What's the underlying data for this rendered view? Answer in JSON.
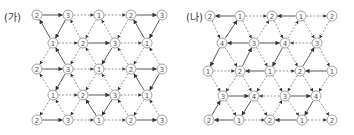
{
  "diagrams": [
    {
      "id": "ga",
      "label": "(가)",
      "label_pos": [
        4,
        9
      ],
      "nodes": [
        {
          "x": 37,
          "y": 15,
          "v": "2"
        },
        {
          "x": 68,
          "y": 15,
          "v": "3"
        },
        {
          "x": 99,
          "y": 15,
          "v": "1"
        },
        {
          "x": 131,
          "y": 15,
          "v": "2"
        },
        {
          "x": 162,
          "y": 15,
          "v": "3"
        },
        {
          "x": 53,
          "y": 43,
          "v": "1"
        },
        {
          "x": 83,
          "y": 43,
          "v": "2"
        },
        {
          "x": 115,
          "y": 43,
          "v": "3"
        },
        {
          "x": 147,
          "y": 43,
          "v": "1"
        },
        {
          "x": 37,
          "y": 69,
          "v": "2"
        },
        {
          "x": 68,
          "y": 69,
          "v": "3"
        },
        {
          "x": 99,
          "y": 69,
          "v": "1"
        },
        {
          "x": 131,
          "y": 69,
          "v": "2"
        },
        {
          "x": 162,
          "y": 69,
          "v": "3"
        },
        {
          "x": 53,
          "y": 95,
          "v": "1"
        },
        {
          "x": 83,
          "y": 95,
          "v": "2"
        },
        {
          "x": 115,
          "y": 95,
          "v": "3"
        },
        {
          "x": 147,
          "y": 95,
          "v": "1"
        },
        {
          "x": 37,
          "y": 120,
          "v": "2"
        },
        {
          "x": 68,
          "y": 120,
          "v": "3"
        },
        {
          "x": 99,
          "y": 120,
          "v": "1"
        },
        {
          "x": 131,
          "y": 120,
          "v": "2"
        },
        {
          "x": 162,
          "y": 120,
          "v": "3"
        }
      ],
      "edges": [
        {
          "a": 0,
          "b": 1,
          "s": "solid"
        },
        {
          "a": 1,
          "b": 2,
          "s": "dash"
        },
        {
          "a": 2,
          "b": 3,
          "s": "dash"
        },
        {
          "a": 3,
          "b": 4,
          "s": "solid"
        },
        {
          "a": 5,
          "b": 6,
          "s": "dash"
        },
        {
          "a": 6,
          "b": 7,
          "s": "solid"
        },
        {
          "a": 7,
          "b": 8,
          "s": "dash"
        },
        {
          "a": 9,
          "b": 10,
          "s": "solid"
        },
        {
          "a": 10,
          "b": 11,
          "s": "dash"
        },
        {
          "a": 11,
          "b": 12,
          "s": "dash"
        },
        {
          "a": 12,
          "b": 13,
          "s": "solid"
        },
        {
          "a": 14,
          "b": 15,
          "s": "dash"
        },
        {
          "a": 15,
          "b": 16,
          "s": "solid"
        },
        {
          "a": 16,
          "b": 17,
          "s": "dash"
        },
        {
          "a": 18,
          "b": 19,
          "s": "solid"
        },
        {
          "a": 19,
          "b": 20,
          "s": "dash"
        },
        {
          "a": 20,
          "b": 21,
          "s": "dash"
        },
        {
          "a": 21,
          "b": 22,
          "s": "solid"
        },
        {
          "a": 5,
          "b": 0,
          "s": "solid"
        },
        {
          "a": 1,
          "b": 5,
          "s": "solid"
        },
        {
          "a": 6,
          "b": 1,
          "s": "dash"
        },
        {
          "a": 2,
          "b": 6,
          "s": "dash"
        },
        {
          "a": 7,
          "b": 2,
          "s": "dash"
        },
        {
          "a": 3,
          "b": 7,
          "s": "dash"
        },
        {
          "a": 8,
          "b": 3,
          "s": "solid"
        },
        {
          "a": 4,
          "b": 8,
          "s": "solid"
        },
        {
          "a": 5,
          "b": 9,
          "s": "dash"
        },
        {
          "a": 10,
          "b": 5,
          "s": "solid"
        },
        {
          "a": 6,
          "b": 10,
          "s": "dash"
        },
        {
          "a": 11,
          "b": 6,
          "s": "dash"
        },
        {
          "a": 7,
          "b": 11,
          "s": "solid"
        },
        {
          "a": 12,
          "b": 7,
          "s": "dash"
        },
        {
          "a": 8,
          "b": 12,
          "s": "dash"
        },
        {
          "a": 13,
          "b": 8,
          "s": "dash"
        },
        {
          "a": 14,
          "b": 9,
          "s": "dash"
        },
        {
          "a": 10,
          "b": 14,
          "s": "solid"
        },
        {
          "a": 15,
          "b": 10,
          "s": "dash"
        },
        {
          "a": 11,
          "b": 15,
          "s": "dash"
        },
        {
          "a": 16,
          "b": 11,
          "s": "dash"
        },
        {
          "a": 12,
          "b": 16,
          "s": "dash"
        },
        {
          "a": 17,
          "b": 12,
          "s": "solid"
        },
        {
          "a": 13,
          "b": 17,
          "s": "solid"
        },
        {
          "a": 14,
          "b": 18,
          "s": "dash"
        },
        {
          "a": 19,
          "b": 14,
          "s": "dash"
        },
        {
          "a": 15,
          "b": 19,
          "s": "dash"
        },
        {
          "a": 20,
          "b": 15,
          "s": "solid"
        },
        {
          "a": 16,
          "b": 20,
          "s": "solid"
        },
        {
          "a": 21,
          "b": 16,
          "s": "dash"
        },
        {
          "a": 17,
          "b": 21,
          "s": "dash"
        },
        {
          "a": 22,
          "b": 17,
          "s": "dash"
        }
      ]
    },
    {
      "id": "na",
      "label": "(나)",
      "label_pos": [
        186,
        9
      ],
      "nodes": [
        {
          "x": 210,
          "y": 16,
          "v": "2"
        },
        {
          "x": 240,
          "y": 16,
          "v": "1"
        },
        {
          "x": 272,
          "y": 16,
          "v": "2"
        },
        {
          "x": 301,
          "y": 16,
          "v": "1"
        },
        {
          "x": 332,
          "y": 16,
          "v": "2"
        },
        {
          "x": 222,
          "y": 43,
          "v": "4"
        },
        {
          "x": 254,
          "y": 43,
          "v": "3"
        },
        {
          "x": 285,
          "y": 43,
          "v": "4"
        },
        {
          "x": 317,
          "y": 43,
          "v": "3"
        },
        {
          "x": 208,
          "y": 71,
          "v": "1"
        },
        {
          "x": 240,
          "y": 71,
          "v": "2"
        },
        {
          "x": 270,
          "y": 71,
          "v": "1"
        },
        {
          "x": 300,
          "y": 71,
          "v": "2"
        },
        {
          "x": 332,
          "y": 71,
          "v": "1"
        },
        {
          "x": 223,
          "y": 96,
          "v": "3"
        },
        {
          "x": 254,
          "y": 96,
          "v": "4"
        },
        {
          "x": 285,
          "y": 96,
          "v": "3"
        },
        {
          "x": 316,
          "y": 96,
          "v": "4"
        },
        {
          "x": 209,
          "y": 120,
          "v": "2"
        },
        {
          "x": 239,
          "y": 120,
          "v": "1"
        },
        {
          "x": 270,
          "y": 120,
          "v": "2"
        },
        {
          "x": 302,
          "y": 120,
          "v": "1"
        },
        {
          "x": 332,
          "y": 120,
          "v": "2"
        }
      ],
      "edges": [
        {
          "a": 1,
          "b": 0,
          "s": "solid"
        },
        {
          "a": 1,
          "b": 2,
          "s": "dash"
        },
        {
          "a": 3,
          "b": 2,
          "s": "solid"
        },
        {
          "a": 3,
          "b": 4,
          "s": "dash"
        },
        {
          "a": 6,
          "b": 5,
          "s": "solid"
        },
        {
          "a": 6,
          "b": 7,
          "s": "solid"
        },
        {
          "a": 8,
          "b": 7,
          "s": "dash"
        },
        {
          "a": 9,
          "b": 10,
          "s": "dash"
        },
        {
          "a": 11,
          "b": 10,
          "s": "solid"
        },
        {
          "a": 11,
          "b": 12,
          "s": "dash"
        },
        {
          "a": 13,
          "b": 12,
          "s": "solid"
        },
        {
          "a": 14,
          "b": 15,
          "s": "solid"
        },
        {
          "a": 16,
          "b": 15,
          "s": "dash"
        },
        {
          "a": 16,
          "b": 17,
          "s": "solid"
        },
        {
          "a": 19,
          "b": 18,
          "s": "solid"
        },
        {
          "a": 19,
          "b": 20,
          "s": "dash"
        },
        {
          "a": 21,
          "b": 20,
          "s": "solid"
        },
        {
          "a": 21,
          "b": 22,
          "s": "dash"
        },
        {
          "a": 0,
          "b": 5,
          "s": "dash"
        },
        {
          "a": 5,
          "b": 1,
          "s": "solid"
        },
        {
          "a": 1,
          "b": 6,
          "s": "dash"
        },
        {
          "a": 6,
          "b": 2,
          "s": "dash"
        },
        {
          "a": 2,
          "b": 7,
          "s": "dash"
        },
        {
          "a": 7,
          "b": 3,
          "s": "dash"
        },
        {
          "a": 3,
          "b": 8,
          "s": "dash"
        },
        {
          "a": 4,
          "b": 8,
          "s": "dash"
        },
        {
          "a": 5,
          "b": 9,
          "s": "solid"
        },
        {
          "a": 5,
          "b": 10,
          "s": "dash"
        },
        {
          "a": 10,
          "b": 6,
          "s": "solid"
        },
        {
          "a": 6,
          "b": 11,
          "s": "dash"
        },
        {
          "a": 7,
          "b": 11,
          "s": "solid"
        },
        {
          "a": 7,
          "b": 12,
          "s": "dash"
        },
        {
          "a": 12,
          "b": 8,
          "s": "solid"
        },
        {
          "a": 8,
          "b": 13,
          "s": "dash"
        },
        {
          "a": 9,
          "b": 14,
          "s": "dash"
        },
        {
          "a": 10,
          "b": 14,
          "s": "dash"
        },
        {
          "a": 10,
          "b": 15,
          "s": "dash"
        },
        {
          "a": 11,
          "b": 15,
          "s": "dash"
        },
        {
          "a": 11,
          "b": 16,
          "s": "dash"
        },
        {
          "a": 12,
          "b": 16,
          "s": "dash"
        },
        {
          "a": 12,
          "b": 17,
          "s": "dash"
        },
        {
          "a": 13,
          "b": 17,
          "s": "dash"
        },
        {
          "a": 18,
          "b": 14,
          "s": "solid"
        },
        {
          "a": 14,
          "b": 19,
          "s": "dash"
        },
        {
          "a": 15,
          "b": 19,
          "s": "solid"
        },
        {
          "a": 15,
          "b": 20,
          "s": "dash"
        },
        {
          "a": 20,
          "b": 16,
          "s": "dash"
        },
        {
          "a": 16,
          "b": 21,
          "s": "dash"
        },
        {
          "a": 17,
          "b": 21,
          "s": "solid"
        },
        {
          "a": 17,
          "b": 22,
          "s": "dash"
        }
      ]
    }
  ],
  "colors": {
    "stroke": "#444444",
    "dash": "#666666",
    "node_stroke": "#777777",
    "node_fill": "#ffffff"
  }
}
